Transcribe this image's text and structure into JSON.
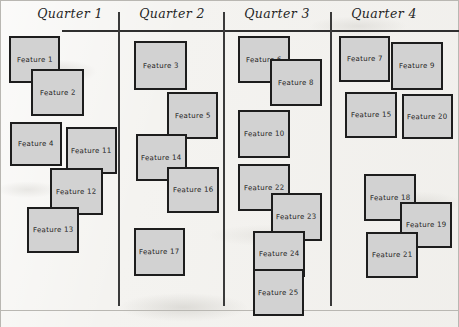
{
  "board": {
    "title": "Quarterly Feature Roadmap",
    "background_color": "#f4f3f0",
    "card_fill_color": "#d2d2d2",
    "card_border_color": "#1d1d1d",
    "rule_color": "#2f2f2f",
    "width": 459,
    "height": 327
  },
  "header_rule": {
    "x": 62,
    "y": 30,
    "width": 397
  },
  "columns": [
    {
      "id": "q1",
      "label": "Quarter 1",
      "label_x": 22,
      "label_width": 96,
      "divider_x": 118,
      "divider_y": 12,
      "divider_height": 294
    },
    {
      "id": "q2",
      "label": "Quarter 2",
      "label_x": 124,
      "label_width": 96,
      "divider_x": 223,
      "divider_y": 12,
      "divider_height": 294
    },
    {
      "id": "q3",
      "label": "Quarter 3",
      "label_x": 229,
      "label_width": 96,
      "divider_x": 330,
      "divider_y": 12,
      "divider_height": 294
    },
    {
      "id": "q4",
      "label": "Quarter 4",
      "label_x": 336,
      "label_width": 96,
      "divider_x": 0,
      "divider_y": 0,
      "divider_height": 0
    }
  ],
  "cards": [
    {
      "label": "Feature 1",
      "column": "q1",
      "x": 9,
      "y": 36,
      "w": 51,
      "h": 47
    },
    {
      "label": "Feature 2",
      "column": "q1",
      "x": 31,
      "y": 69,
      "w": 53,
      "h": 47
    },
    {
      "label": "Feature 4",
      "column": "q1",
      "x": 10,
      "y": 122,
      "w": 52,
      "h": 44
    },
    {
      "label": "Feature 11",
      "column": "q1",
      "x": 66,
      "y": 127,
      "w": 51,
      "h": 47
    },
    {
      "label": "Feature 12",
      "column": "q1",
      "x": 50,
      "y": 168,
      "w": 53,
      "h": 47
    },
    {
      "label": "Feature 13",
      "column": "q1",
      "x": 27,
      "y": 207,
      "w": 52,
      "h": 46
    },
    {
      "label": "Feature 3",
      "column": "q2",
      "x": 134,
      "y": 41,
      "w": 53,
      "h": 49
    },
    {
      "label": "Feature 5",
      "column": "q2",
      "x": 167,
      "y": 92,
      "w": 51,
      "h": 47
    },
    {
      "label": "Feature 14",
      "column": "q2",
      "x": 136,
      "y": 134,
      "w": 51,
      "h": 47
    },
    {
      "label": "Feature 16",
      "column": "q2",
      "x": 167,
      "y": 167,
      "w": 52,
      "h": 46
    },
    {
      "label": "Feature 17",
      "column": "q2",
      "x": 134,
      "y": 228,
      "w": 51,
      "h": 48
    },
    {
      "label": "Feature 6",
      "column": "q3",
      "x": 238,
      "y": 36,
      "w": 52,
      "h": 47
    },
    {
      "label": "Feature 8",
      "column": "q3",
      "x": 270,
      "y": 59,
      "w": 52,
      "h": 47
    },
    {
      "label": "Feature 10",
      "column": "q3",
      "x": 238,
      "y": 110,
      "w": 52,
      "h": 48
    },
    {
      "label": "Feature 22",
      "column": "q3",
      "x": 238,
      "y": 164,
      "w": 52,
      "h": 47
    },
    {
      "label": "Feature 23",
      "column": "q3",
      "x": 271,
      "y": 193,
      "w": 51,
      "h": 48
    },
    {
      "label": "Feature 24",
      "column": "q3",
      "x": 253,
      "y": 231,
      "w": 52,
      "h": 46
    },
    {
      "label": "Feature 25",
      "column": "q3",
      "x": 253,
      "y": 269,
      "w": 51,
      "h": 47
    },
    {
      "label": "Feature 7",
      "column": "q4",
      "x": 339,
      "y": 36,
      "w": 51,
      "h": 46
    },
    {
      "label": "Feature 9",
      "column": "q4",
      "x": 391,
      "y": 42,
      "w": 52,
      "h": 48
    },
    {
      "label": "Feature 15",
      "column": "q4",
      "x": 345,
      "y": 92,
      "w": 52,
      "h": 46
    },
    {
      "label": "Feature 20",
      "column": "q4",
      "x": 402,
      "y": 94,
      "w": 51,
      "h": 45
    },
    {
      "label": "Feature 18",
      "column": "q4",
      "x": 364,
      "y": 174,
      "w": 52,
      "h": 47
    },
    {
      "label": "Feature 19",
      "column": "q4",
      "x": 400,
      "y": 202,
      "w": 52,
      "h": 46
    },
    {
      "label": "Feature 21",
      "column": "q4",
      "x": 366,
      "y": 232,
      "w": 52,
      "h": 46
    }
  ]
}
